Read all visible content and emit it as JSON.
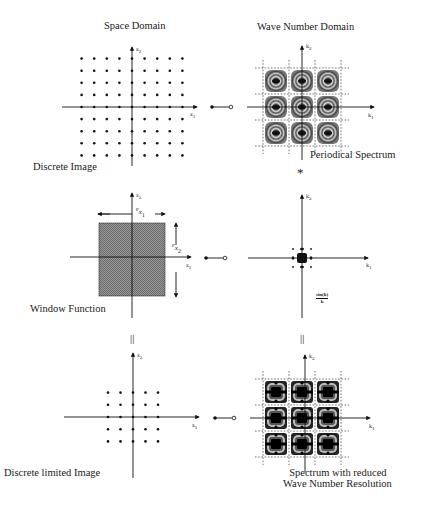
{
  "titles": {
    "left": "Space Domain",
    "right": "Wave Number Domain"
  },
  "rows": [
    {
      "left_caption": "Discrete Image",
      "right_caption": "Periodical Spectrum",
      "left_axes": {
        "x": "x1",
        "y": "x2"
      },
      "right_axes": {
        "x": "k1",
        "y": "k2"
      },
      "left_content": "9x9 grid of sample points",
      "right_content": "3x3 periodic spectrum replicas in dashed grid cells"
    },
    {
      "left_caption": "Window Function",
      "right_caption": "sin(k)/k",
      "left_axes": {
        "x": "x1",
        "y": "x2"
      },
      "right_axes": {
        "x": "k1",
        "y": "k2"
      },
      "window_dims": {
        "width": "Px1",
        "height": "Px2"
      },
      "left_content": "shaded rectangular window",
      "right_content": "sinc-shaped spectrum at origin"
    },
    {
      "left_caption": "Discrete limited Image",
      "right_caption_line1": "Spectrum with reduced",
      "right_caption_line2": "Wave Number Resolution",
      "left_axes": {
        "x": "x1",
        "y": "x2"
      },
      "right_axes": {
        "x": "k1",
        "y": "k2"
      },
      "left_content": "5x5 grid of sample points",
      "right_content": "3x3 smeared spectrum replicas"
    }
  ],
  "operators": {
    "convolution": "*",
    "equals_left": "||",
    "equals_right": "||"
  },
  "labels": {
    "x1": "x",
    "x1_sub": "1",
    "x2": "x",
    "x2_sub": "2",
    "k1": "k",
    "k1_sub": "1",
    "k2": "k",
    "k2_sub": "2",
    "px1": "P",
    "px1_x": "x",
    "px1_sub": "1",
    "px2": "P",
    "px2_x": "x",
    "px2_sub": "2",
    "sinc_num": "sin(k)",
    "sinc_den": "k"
  },
  "colors": {
    "ink": "#111111",
    "window_fill": "#8a8a8a",
    "background": "#ffffff"
  }
}
